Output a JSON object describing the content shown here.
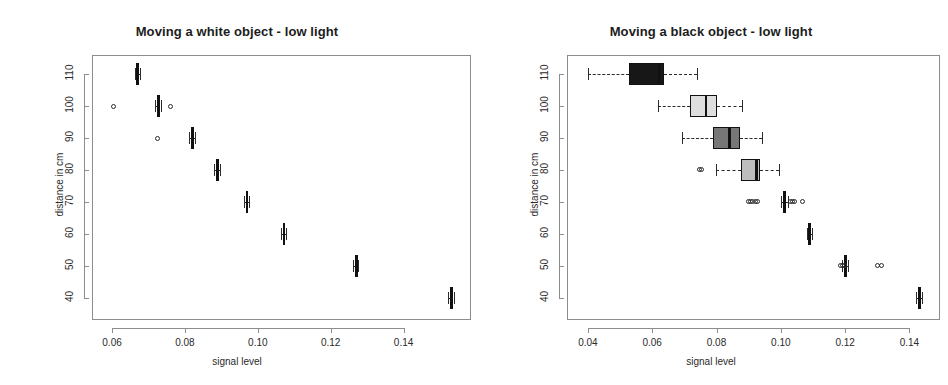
{
  "figure": {
    "width": 948,
    "height": 385,
    "background": "#ffffff",
    "foreground": "#1a1a1a"
  },
  "panels": [
    {
      "id": "white-object-low-light",
      "title": "Moving a white object - low light",
      "xlabel": "signal level",
      "ylabel": "distance in cm"
    },
    {
      "id": "black-object-low-light",
      "title": "Moving a black object - low light",
      "xlabel": "signal level",
      "ylabel": "distance in cm"
    }
  ],
  "chart_data": [
    {
      "type": "boxplot",
      "orientation": "horizontal",
      "panel": "left",
      "title": "Moving a white object - low light",
      "xlabel": "signal level",
      "ylabel": "distance in cm",
      "xlim": [
        0.0545,
        0.1585
      ],
      "ylim": [
        33,
        116
      ],
      "xticks": [
        0.06,
        0.08,
        0.1,
        0.12,
        0.14
      ],
      "xticklabels": [
        "0.06",
        "0.08",
        "0.10",
        "0.12",
        "0.14"
      ],
      "yticks": [
        40,
        50,
        60,
        70,
        80,
        90,
        100,
        110
      ],
      "yticklabels": [
        "40",
        "50",
        "60",
        "70",
        "80",
        "90",
        "100",
        "110"
      ],
      "grid": false,
      "legend": false,
      "boxes": [
        {
          "category": 110,
          "q1": 0.0668,
          "median": 0.0668,
          "q3": 0.067,
          "whisker_low": 0.0662,
          "whisker_high": 0.0676,
          "fill": "#111111",
          "outliers": []
        },
        {
          "category": 100,
          "q1": 0.0724,
          "median": 0.0725,
          "q3": 0.0727,
          "whisker_low": 0.0718,
          "whisker_high": 0.0733,
          "fill": "#111111",
          "outliers": [
            0.0605,
            0.076
          ]
        },
        {
          "category": 90,
          "q1": 0.0818,
          "median": 0.082,
          "q3": 0.0822,
          "whisker_low": 0.0812,
          "whisker_high": 0.0827,
          "fill": "#111111",
          "outliers": [
            0.0726
          ]
        },
        {
          "category": 80,
          "q1": 0.0887,
          "median": 0.0889,
          "q3": 0.0891,
          "whisker_low": 0.0881,
          "whisker_high": 0.0896,
          "fill": "#111111",
          "outliers": []
        },
        {
          "category": 70,
          "q1": 0.0967,
          "median": 0.0969,
          "q3": 0.0971,
          "whisker_low": 0.0962,
          "whisker_high": 0.0976,
          "fill": "#111111",
          "outliers": []
        },
        {
          "category": 60,
          "q1": 0.1069,
          "median": 0.1071,
          "q3": 0.1073,
          "whisker_low": 0.1063,
          "whisker_high": 0.1078,
          "fill": "#111111",
          "outliers": []
        },
        {
          "category": 50,
          "q1": 0.1267,
          "median": 0.1269,
          "q3": 0.1271,
          "whisker_low": 0.1261,
          "whisker_high": 0.1276,
          "fill": "#111111",
          "outliers": []
        },
        {
          "category": 40,
          "q1": 0.1528,
          "median": 0.153,
          "q3": 0.1532,
          "whisker_low": 0.1522,
          "whisker_high": 0.1537,
          "fill": "#111111",
          "outliers": []
        }
      ]
    },
    {
      "type": "boxplot",
      "orientation": "horizontal",
      "panel": "right",
      "title": "Moving a black object - low light",
      "xlabel": "signal level",
      "ylabel": "distance in cm",
      "xlim": [
        0.0335,
        0.1495
      ],
      "ylim": [
        33,
        116
      ],
      "xticks": [
        0.04,
        0.06,
        0.08,
        0.1,
        0.12,
        0.14
      ],
      "xticklabels": [
        "0.04",
        "0.06",
        "0.08",
        "0.10",
        "0.12",
        "0.14"
      ],
      "yticks": [
        40,
        50,
        60,
        70,
        80,
        90,
        100,
        110
      ],
      "yticklabels": [
        "40",
        "50",
        "60",
        "70",
        "80",
        "90",
        "100",
        "110"
      ],
      "grid": false,
      "legend": false,
      "boxes": [
        {
          "category": 110,
          "q1": 0.0527,
          "median": 0.062,
          "q3": 0.0638,
          "whisker_low": 0.04,
          "whisker_high": 0.074,
          "fill": "#171717",
          "outliers": []
        },
        {
          "category": 100,
          "q1": 0.0718,
          "median": 0.0766,
          "q3": 0.08,
          "whisker_low": 0.0618,
          "whisker_high": 0.088,
          "fill": "#dedede",
          "outliers": []
        },
        {
          "category": 90,
          "q1": 0.0788,
          "median": 0.084,
          "q3": 0.0872,
          "whisker_low": 0.0693,
          "whisker_high": 0.094,
          "fill": "#777777",
          "outliers": []
        },
        {
          "category": 80,
          "q1": 0.0875,
          "median": 0.0923,
          "q3": 0.0936,
          "whisker_low": 0.0798,
          "whisker_high": 0.0995,
          "fill": "#bdbdbd",
          "outliers": [
            0.0747,
            0.0753
          ]
        },
        {
          "category": 70,
          "q1": 0.1008,
          "median": 0.1012,
          "q3": 0.1016,
          "whisker_low": 0.1,
          "whisker_high": 0.1022,
          "fill": "#111111",
          "outliers": [
            0.0898,
            0.0906,
            0.0913,
            0.092,
            0.0927,
            0.1029,
            0.1035,
            0.1042,
            0.1068
          ]
        },
        {
          "category": 60,
          "q1": 0.1086,
          "median": 0.1089,
          "q3": 0.1092,
          "whisker_low": 0.108,
          "whisker_high": 0.1098,
          "fill": "#111111",
          "outliers": []
        },
        {
          "category": 50,
          "q1": 0.1197,
          "median": 0.12,
          "q3": 0.1203,
          "whisker_low": 0.1191,
          "whisker_high": 0.1209,
          "fill": "#111111",
          "outliers": [
            0.1185,
            0.1192,
            0.1199,
            0.13,
            0.1314
          ]
        },
        {
          "category": 40,
          "q1": 0.1427,
          "median": 0.143,
          "q3": 0.1433,
          "whisker_low": 0.1421,
          "whisker_high": 0.1439,
          "fill": "#111111",
          "outliers": []
        }
      ]
    }
  ]
}
